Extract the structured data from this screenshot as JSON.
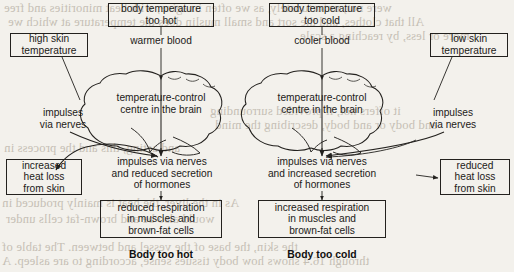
{
  "figure": {
    "stroke_color": "#23211e",
    "text_color": "#1c1a18",
    "background_color": "#f3f1ec",
    "bleed_text_color": "#b9b2a6"
  },
  "left_panel": {
    "caption": "Body too hot",
    "trigger_box": "body temperature\ntoo hot",
    "blood_label": "warmer blood",
    "skin_box": "high skin\ntemperature",
    "skin_impulses_label": "impulses\nvia nerves",
    "brain_label": "temperature-control\ncentre in the brain",
    "output_label": "impulses via nerves\nand reduced secretion\nof hormones",
    "heat_box": "increased\nheat loss\nfrom skin",
    "respiration_box": "reduced respiration\nin muscles and\nbrown-fat cells"
  },
  "right_panel": {
    "caption": "Body too cold",
    "trigger_box": "body temperature\ntoo cold",
    "blood_label": "cooler blood",
    "skin_box": "low skin\ntemperature",
    "skin_impulses_label": "impulses\nvia nerves",
    "brain_label": "temperature-control\ncentre in the brain",
    "output_label": "impulses via nerves\nand increased secretion\nof hormones",
    "heat_box": "reduced\nheat loss\nfrom skin",
    "respiration_box": "increased respiration\nin muscles and\nbrown-fat cells"
  },
  "page_bleed": {
    "line1": "were not, unfortunately, as we often imagine, with heat minorities and free",
    "line2": "All that clothes, and the sort and small muslin does the temperature at which we",
    "line3": "more or less, by reaching a scale",
    "line4": "it offers not, if provided surrounding",
    "line5": "and body or and body, describing the mind",
    "line6": "and acting, this and the process in",
    "line7": "As in the liver, the heat is mainly produced in",
    "line8": "would also be and brown-fat cells under",
    "line9": "the skin, the base of the vessel and between. The table of",
    "line10": "through 16.4 shows how body tissues sense, according to are asleep. A"
  }
}
